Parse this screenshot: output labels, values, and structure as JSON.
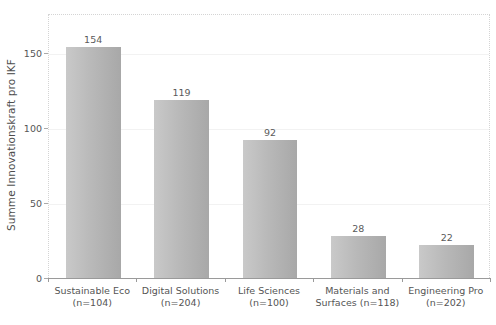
{
  "chart_data": {
    "type": "bar",
    "title": "",
    "xlabel": "",
    "ylabel": "Summe Innovationskraft pro IKF",
    "categories": [
      "Sustainable Eco\n(n=104)",
      "Digital Solutions\n(n=204)",
      "Life Sciences\n(n=100)",
      "Materials and\nSurfaces (n=118)",
      "Engineering Pro\n(n=202)"
    ],
    "category_names": [
      "Sustainable Eco",
      "Digital Solutions",
      "Life Sciences",
      "Materials and Surfaces",
      "Engineering Pro"
    ],
    "sample_sizes": [
      "n=104",
      "n=204",
      "n=100",
      "n=118",
      "n=202"
    ],
    "values": [
      154,
      119,
      92,
      28,
      22
    ],
    "value_labels": [
      "154",
      "119",
      "92",
      "28",
      "22"
    ],
    "ylim": [
      0,
      176
    ],
    "yticks": [
      0,
      50,
      100,
      150
    ],
    "ytick_labels": [
      "0",
      "50",
      "100",
      "150"
    ],
    "grid": true,
    "legend": false,
    "bar_color_start": "#c9c9c9",
    "bar_color_end": "#a8a8a8",
    "axis_color": "#9a9a9a",
    "text_color": "#555555",
    "background": "#ffffff"
  }
}
